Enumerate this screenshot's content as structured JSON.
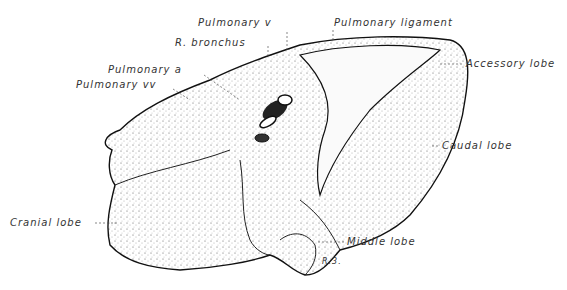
{
  "figure": {
    "labels": {
      "pulmonary_v": "Pulmonary v",
      "pulmonary_ligament": "Pulmonary ligament",
      "r_bronchus": "R. bronchus",
      "pulmonary_a": "Pulmonary a",
      "pulmonary_vv": "Pulmonary vv",
      "accessory_lobe": "Accessory lobe",
      "caudal_lobe": "Caudal lobe",
      "cranial_lobe": "Cranial lobe",
      "middle_lobe": "Middle lobe"
    },
    "signature": "R.3."
  }
}
